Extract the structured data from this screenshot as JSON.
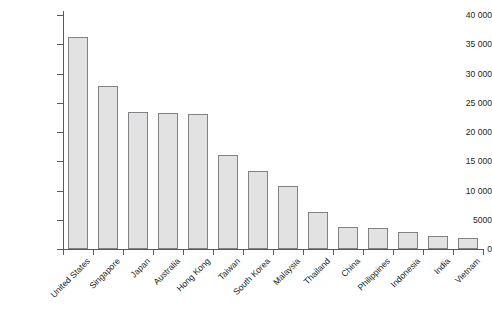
{
  "chart_data": {
    "type": "bar",
    "title": "",
    "subtitle": "",
    "xlabel": "",
    "ylabel": "GDP per capita US$",
    "ylim": [
      0,
      40000
    ],
    "ytick_step": 5000,
    "grid": false,
    "legend": false,
    "orientation": "vertical",
    "bar_fill_color": "#e2e2e2",
    "bar_border_color": "#808285",
    "axis_color": "#58595b",
    "text_color": "#231f20",
    "categories": [
      "United States",
      "Singapore",
      "Japan",
      "Australia",
      "Hong Kong",
      "Taiwan",
      "South Korea",
      "Malaysia",
      "Thailand",
      "China",
      "Philippines",
      "Indonesia",
      "India",
      "Vietnam"
    ],
    "values": [
      36200,
      27800,
      23400,
      23300,
      23000,
      16100,
      13300,
      10700,
      6400,
      3700,
      3600,
      2900,
      2300,
      1900
    ],
    "ytick_labels": [
      "0",
      "5000",
      "10 000",
      "15 000",
      "20 000",
      "25 000",
      "30 000",
      "35 000",
      "40 000"
    ],
    "ytick_values": [
      0,
      5000,
      10000,
      15000,
      20000,
      25000,
      30000,
      35000,
      40000
    ]
  }
}
